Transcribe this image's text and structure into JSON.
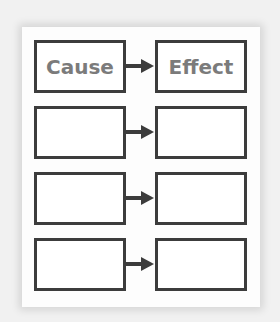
{
  "diagram": {
    "type": "cause-effect graphic organizer",
    "rows": [
      {
        "cause": "Cause",
        "effect": "Effect"
      },
      {
        "cause": "",
        "effect": ""
      },
      {
        "cause": "",
        "effect": ""
      },
      {
        "cause": "",
        "effect": ""
      }
    ],
    "colors": {
      "border": "#3c3c3c",
      "text": "#7b7b7b",
      "card": "#fdfdfd",
      "background": "#f1f1f1"
    }
  }
}
